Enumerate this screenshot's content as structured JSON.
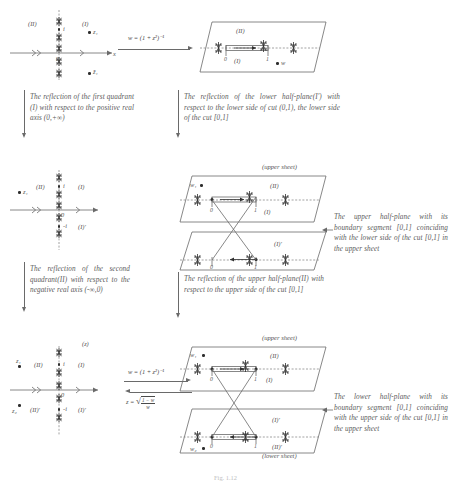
{
  "figure": {
    "caption": "Fig. 1.12"
  },
  "transforms": {
    "forward": "w = (1 + z²)⁻¹",
    "inverse_prefix": "z = ",
    "inverse_radical_num": "1 − w",
    "inverse_radical_den": "w"
  },
  "row1": {
    "zplane": {
      "quadrant_left": "(II)",
      "quadrant_right": "(I)",
      "point_i": "i",
      "point_z1": "z₁",
      "point_z1bar": "z̄₁",
      "origin": "0",
      "axis_label": "x"
    },
    "wplane": {
      "label_upper": "(II)",
      "label_lower": "(I)",
      "tick_zero": "0",
      "tick_one": "1",
      "point_w": "w"
    },
    "caption_left": "The reflection of the first quadrant (I) with respect to the positive real axis (0,+∞)",
    "caption_right": "The reflection of the lower half-plane(I′) with respect to the lower side of cut (0,1), the lower side of the cut [0,1]"
  },
  "row2": {
    "zplane": {
      "quadrant_upper_left": "(II)",
      "quadrant_upper_right": "(I)",
      "quadrant_lower_right": "(I)′",
      "point_i": "i",
      "point_minus_i": "-i",
      "point_z1": "z₁",
      "origin": "0"
    },
    "upper_sheet_label": "(upper sheet)",
    "sheet_upper": {
      "label_upper": "(II)",
      "label_lower": "(I)",
      "tick_zero": "0",
      "tick_one": "1",
      "point_w": "w₁"
    },
    "sheet_lower": {
      "label": "(I)′",
      "tick_zero": "0",
      "tick_one": "1"
    },
    "caption_left": "The reflection of the second quadrant(II) with respect to the negative real axis (-∞,0)",
    "caption_mid": "The reflection of the upper half-plane(II) with respect to the upper side of the cut [0,1]",
    "caption_right": "The upper half-plane with its boundary segment [0,1] coinciding with the lower side of the cut [0,1] in the upper sheet"
  },
  "row3": {
    "zplane": {
      "quadrant_upper_left": "(II)",
      "quadrant_upper_right": "(I)",
      "quadrant_lower_left": "(II)′",
      "quadrant_lower_right": "(I)′",
      "point_i": "i",
      "point_minus_i": "-i",
      "point_z1": "z₁",
      "point_z2": "z₂",
      "origin": "0",
      "top_label": "(z)"
    },
    "upper_sheet_label": "(upper sheet)",
    "lower_sheet_label": "(lower sheet)",
    "sheet_upper": {
      "label_upper": "(II)",
      "label_lower": "(I)",
      "tick_zero": "0",
      "tick_one": "1",
      "point_w": "w₁"
    },
    "sheet_lower": {
      "label_upper": "(I)′",
      "label_lower": "(II)′",
      "tick_zero": "0",
      "tick_one": "1",
      "point_w": "w₂"
    },
    "caption_right": "The lower half-plane with its boundary segment [0,1] coinciding with the upper side of the cut [0,1] in the upper sheet"
  }
}
